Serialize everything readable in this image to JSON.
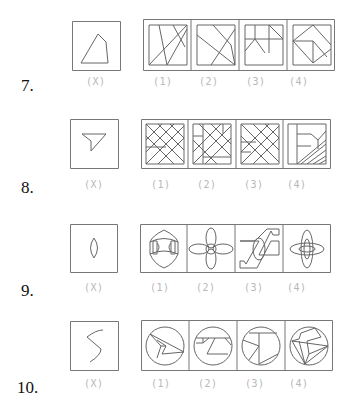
{
  "questions": [
    {
      "number": "7.",
      "labels": [
        "(X)",
        "(1)",
        "(2)",
        "(3)",
        "(4)"
      ],
      "question_figure": "irregular-quadrilateral",
      "options": [
        "square-with-crossing-lines",
        "square-with-diagonal-lines",
        "square-with-zigzag-lines",
        "square-with-diamond-lines"
      ]
    },
    {
      "number": "8.",
      "labels": [
        "(X)",
        "(1)",
        "(2)",
        "(3)",
        "(4)"
      ],
      "question_figure": "triangle-funnel",
      "options": [
        "crosshatched-square",
        "crosshatched-square",
        "crosshatched-square",
        "square-with-partial-hatching"
      ]
    },
    {
      "number": "9.",
      "labels": [
        "(X)",
        "(1)",
        "(2)",
        "(3)",
        "(4)"
      ],
      "question_figure": "ellipse-leaf",
      "options": [
        "shield-with-brackets",
        "four-petal-flower",
        "z-shape-with-ellipse",
        "layered-petals"
      ]
    },
    {
      "number": "10.",
      "labels": [
        "(X)",
        "(1)",
        "(2)",
        "(3)",
        "(4)"
      ],
      "question_figure": "s-curve-line",
      "options": [
        "circle-with-triangle",
        "circle-with-trapezoid",
        "circle-with-t-shape",
        "circle-with-polygon"
      ]
    }
  ],
  "colors": {
    "stroke": "#555555",
    "label": "#b8b8b8",
    "number": "#111111"
  }
}
